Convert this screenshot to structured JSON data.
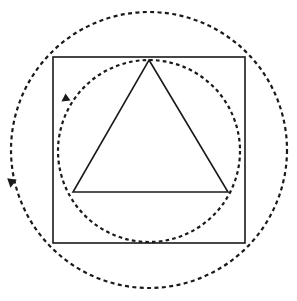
{
  "figure": {
    "title": "Geometric construction: circumscribed circles, square and inscribed triangle",
    "background_color": "#ffffff",
    "stroke_color": "#1a1a1a",
    "width": 297,
    "height": 301,
    "shapes": {
      "outer_circle": {
        "name": "outer-dotted-circle",
        "type": "circle",
        "cx": 149,
        "cy": 150,
        "r": 138,
        "style": "dotted",
        "stroke_color": "#1a1a1a",
        "stroke_width": 2.2,
        "dash_pattern": "4 3.4",
        "fill": "none"
      },
      "inner_circle": {
        "name": "inner-dotted-circle",
        "type": "circle",
        "cx": 149,
        "cy": 151,
        "r": 91,
        "style": "dotted",
        "stroke_color": "#1a1a1a",
        "stroke_width": 2.2,
        "dash_pattern": "3.6 3.2",
        "fill": "none"
      },
      "square": {
        "name": "solid-square",
        "type": "rect",
        "x": 53,
        "y": 57,
        "width": 192,
        "height": 186,
        "style": "solid",
        "stroke_color": "#1a1a1a",
        "stroke_width": 1.6,
        "fill": "none"
      },
      "triangle": {
        "name": "solid-triangle",
        "type": "polygon",
        "points": "149,60 228,192 73,192",
        "apex_x": 149,
        "apex_y": 60,
        "base_left_x": 73,
        "base_left_y": 192,
        "base_right_x": 228,
        "base_right_y": 192,
        "style": "solid",
        "stroke_color": "#1a1a1a",
        "stroke_width": 1.6,
        "fill": "none"
      }
    },
    "arrows": {
      "outer_arrow": {
        "name": "outer-circle-direction-arrow",
        "x": 12,
        "y": 179,
        "rotation_deg": 100,
        "direction": "counterclockwise",
        "size": 9,
        "fill": "#1a1a1a"
      },
      "inner_arrow": {
        "name": "inner-circle-direction-arrow",
        "x": 68,
        "y": 97,
        "rotation_deg": 145,
        "direction": "counterclockwise",
        "size": 8,
        "fill": "#1a1a1a"
      }
    }
  }
}
